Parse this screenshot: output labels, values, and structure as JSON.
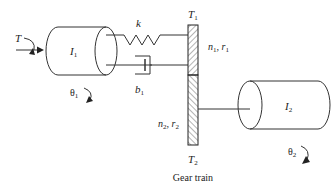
{
  "diagram": {
    "title": "Gear train",
    "labels": {
      "torque": "T",
      "inertia1": "I",
      "inertia1_sub": "1",
      "inertia2": "I",
      "inertia2_sub": "2",
      "spring": "k",
      "damper": "b",
      "damper_sub": "1",
      "theta1": "θ",
      "theta1_sub": "1",
      "theta2": "θ",
      "theta2_sub": "2",
      "gear1_torque": "T",
      "gear1_torque_sub": "1",
      "gear2_torque": "T",
      "gear2_torque_sub": "2",
      "gear1_params": "n",
      "gear1_params_sub1": "1",
      "gear1_params_mid": ", r",
      "gear1_params_sub2": "1",
      "gear2_params": "n",
      "gear2_params_sub1": "2",
      "gear2_params_mid": ", r",
      "gear2_params_sub2": "2"
    },
    "colors": {
      "stroke": "#333333",
      "text": "#222222"
    }
  }
}
